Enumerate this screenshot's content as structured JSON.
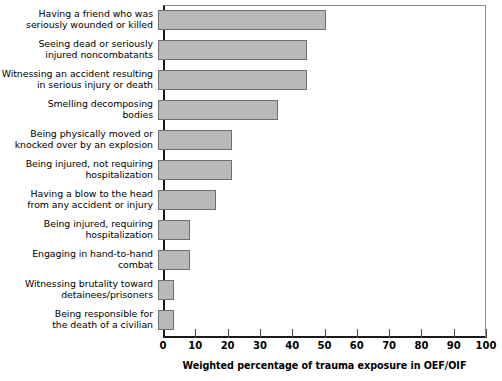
{
  "chart_data": {
    "type": "bar",
    "orientation": "horizontal",
    "title": "",
    "xlabel": "Weighted percentage of trauma exposure in OEF/OIF",
    "ylabel": "",
    "xlim": [
      0,
      100
    ],
    "xticks": [
      0,
      10,
      20,
      30,
      40,
      50,
      60,
      70,
      80,
      90,
      100
    ],
    "grid": false,
    "legend": false,
    "bar_color": "#b9b9b9",
    "bar_edge_color": "#6e6e6e",
    "categories": [
      "Having a friend who was\nseriously wounded or killed",
      "Seeing dead or seriously\ninjured noncombatants",
      "Witnessing an accident resulting\nin serious injury or death",
      "Smelling decomposing\nbodies",
      "Being physically moved or\nknocked over by an explosion",
      "Being injured, not requiring\nhospitalization",
      "Having a blow to the head\nfrom any accident or injury",
      "Being injured, requiring\nhospitalization",
      "Engaging in hand-to-hand\ncombat",
      "Witnessing brutality toward\ndetainees/prisoners",
      "Being responsible for\nthe death of a civilian"
    ],
    "values": [
      52,
      46,
      46,
      37,
      23,
      23,
      18,
      10,
      10,
      5,
      5
    ]
  }
}
